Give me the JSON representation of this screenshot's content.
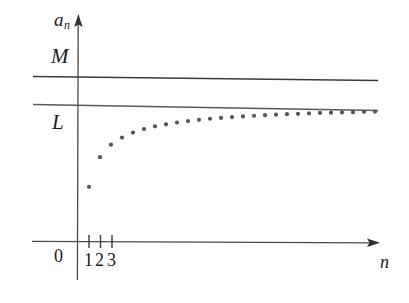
{
  "figure": {
    "background_color": "#ffffff",
    "ink_color": "#333333",
    "dot_color": "#555555"
  },
  "labels": {
    "y_axis": "a",
    "y_axis_subscript": "n",
    "x_axis": "n",
    "origin": "0",
    "bound_upper": "M",
    "limit": "L",
    "tick_1": "1",
    "tick_2": "2",
    "tick_3": "3"
  },
  "chart_data": {
    "type": "scatter",
    "title": "",
    "xlabel": "n",
    "ylabel": "a_n",
    "grid": false,
    "legend": null,
    "xlim": [
      0,
      31
    ],
    "ylim": [
      0,
      1.25
    ],
    "annotations": [
      {
        "name": "M",
        "type": "horizontal-line",
        "y": 1.1,
        "label": "M",
        "label_position": "left-above"
      },
      {
        "name": "L",
        "type": "horizontal-line",
        "y": 1.0,
        "label": "L",
        "label_position": "left-below"
      }
    ],
    "x": [
      1,
      2,
      3,
      4,
      5,
      6,
      7,
      8,
      9,
      10,
      11,
      12,
      13,
      14,
      15,
      16,
      17,
      18,
      19,
      20,
      21,
      22,
      23,
      24,
      25,
      26,
      27
    ],
    "values": [
      0.4,
      0.615,
      0.705,
      0.757,
      0.793,
      0.818,
      0.838,
      0.853,
      0.866,
      0.876,
      0.885,
      0.893,
      0.899,
      0.905,
      0.91,
      0.915,
      0.919,
      0.923,
      0.926,
      0.929,
      0.932,
      0.935,
      0.937,
      0.939,
      0.941,
      0.943,
      0.945
    ],
    "series": [
      {
        "name": "a_n",
        "marker": "dot",
        "values": [
          0.4,
          0.615,
          0.705,
          0.757,
          0.793,
          0.818,
          0.838,
          0.853,
          0.866,
          0.876,
          0.885,
          0.893,
          0.899,
          0.905,
          0.91,
          0.915,
          0.919,
          0.923,
          0.926,
          0.929,
          0.932,
          0.935,
          0.937,
          0.939,
          0.941,
          0.943,
          0.945
        ]
      }
    ],
    "xticks": [
      1,
      2,
      3
    ],
    "xticklabels": [
      "1",
      "2",
      "3"
    ],
    "yticks": [],
    "yticklabels": []
  },
  "geometry": {
    "y_axis_x": 78,
    "y_axis_top": 15,
    "y_axis_bottom": 280,
    "x_axis_y": 242,
    "x_axis_left": 32,
    "x_axis_right": 380,
    "line_M_y_left": 76,
    "line_M_y_right": 80,
    "line_L_y_left": 104,
    "line_L_y_right": 110,
    "band_left": 33,
    "band_right": 378,
    "dot_x_start": 89,
    "dot_x_step": 11,
    "dot_radius": 2.1
  }
}
